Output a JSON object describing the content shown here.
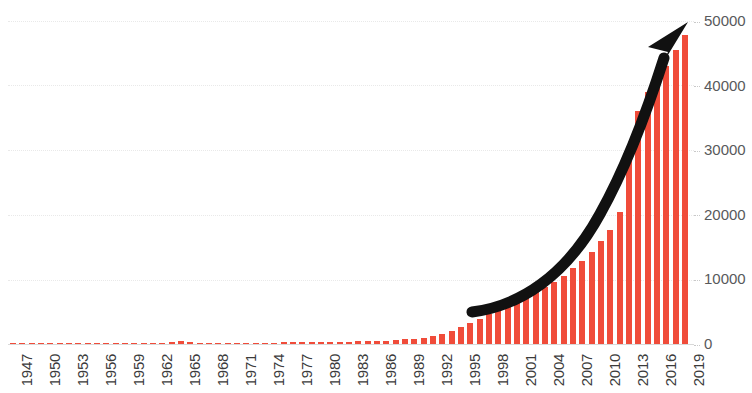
{
  "chart_data": {
    "type": "bar",
    "title": "",
    "subtitle": "",
    "xlabel": "",
    "ylabel": "",
    "grid": true,
    "legend": null,
    "legend_position": "none",
    "bar_color": "#f04c3a",
    "ylim": [
      0,
      50000
    ],
    "yticks": [
      0,
      10000,
      20000,
      30000,
      40000,
      50000
    ],
    "ytick_labels": [
      "0",
      "10000",
      "20000",
      "30000",
      "40000",
      "50000"
    ],
    "xtick_labels": [
      "1947",
      "1950",
      "1953",
      "1956",
      "1959",
      "1962",
      "1965",
      "1968",
      "1971",
      "1974",
      "1977",
      "1980",
      "1983",
      "1986",
      "1989",
      "1992",
      "1995",
      "1998",
      "2001",
      "2004",
      "2007",
      "2010",
      "2013",
      "2016",
      "2019"
    ],
    "xtick_step": 3,
    "x_range": [
      1947,
      2019
    ],
    "categories": [
      "1947",
      "1948",
      "1949",
      "1950",
      "1951",
      "1952",
      "1953",
      "1954",
      "1955",
      "1956",
      "1957",
      "1958",
      "1959",
      "1960",
      "1961",
      "1962",
      "1963",
      "1964",
      "1965",
      "1966",
      "1967",
      "1968",
      "1969",
      "1970",
      "1971",
      "1972",
      "1973",
      "1974",
      "1975",
      "1976",
      "1977",
      "1978",
      "1979",
      "1980",
      "1981",
      "1982",
      "1983",
      "1984",
      "1985",
      "1986",
      "1987",
      "1988",
      "1989",
      "1990",
      "1991",
      "1992",
      "1993",
      "1994",
      "1995",
      "1996",
      "1997",
      "1998",
      "1999",
      "2000",
      "2001",
      "2002",
      "2003",
      "2004",
      "2005",
      "2006",
      "2007",
      "2008",
      "2009",
      "2010",
      "2011",
      "2012",
      "2013",
      "2014",
      "2015",
      "2016",
      "2017",
      "2018",
      "2019"
    ],
    "values": [
      30,
      35,
      40,
      45,
      50,
      55,
      60,
      70,
      80,
      90,
      100,
      110,
      120,
      130,
      150,
      170,
      200,
      320,
      430,
      260,
      180,
      170,
      170,
      180,
      190,
      200,
      210,
      220,
      230,
      250,
      270,
      290,
      300,
      320,
      340,
      360,
      380,
      400,
      430,
      470,
      520,
      600,
      700,
      850,
      1000,
      1200,
      1500,
      2000,
      2600,
      3200,
      3900,
      4600,
      5200,
      5900,
      6600,
      7300,
      8000,
      8800,
      9600,
      10600,
      11700,
      12900,
      14300,
      16000,
      17600,
      20500,
      30000,
      36000,
      39000,
      40300,
      43000,
      45500,
      47800
    ],
    "annotations": [
      {
        "name": "upward-trend-arrow",
        "type": "curved-arrow",
        "color": "#111111",
        "description": "thick black curved arrow sweeping upward to the right"
      }
    ]
  }
}
